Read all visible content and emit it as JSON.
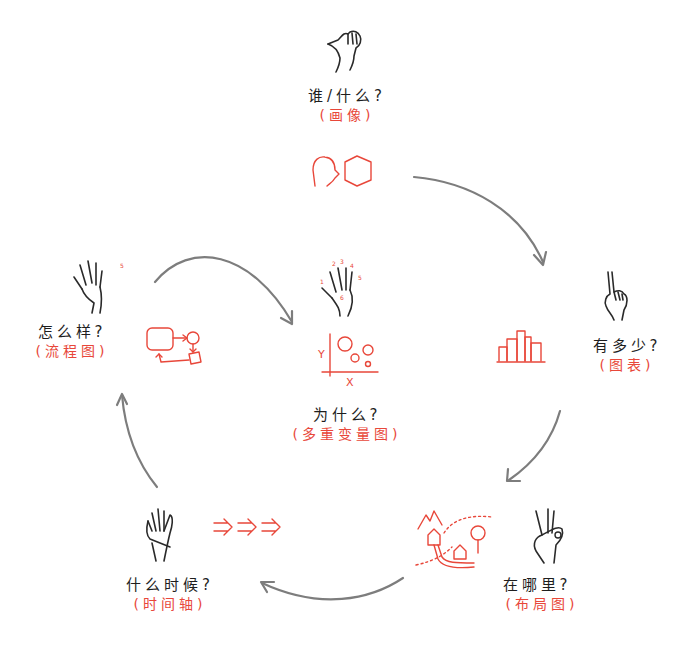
{
  "diagram": {
    "type": "cycle",
    "colors": {
      "text": "#1e1e1e",
      "accent": "#e8473a",
      "arrow": "#7d7d7d"
    },
    "nodes": [
      {
        "id": "who_what",
        "question": "谁/什么?",
        "chart": "(画像)",
        "hand_fingers": "1",
        "icon": "portrait-icon"
      },
      {
        "id": "how_much",
        "question": "有多少?",
        "chart": "(图表)",
        "hand_fingers": "2",
        "icon": "bar-chart-icon"
      },
      {
        "id": "where",
        "question": "在哪里?",
        "chart": "(布局图)",
        "hand_fingers": "3",
        "icon": "map-icon"
      },
      {
        "id": "when",
        "question": "什么时候?",
        "chart": "(时间轴)",
        "hand_fingers": "4",
        "icon": "timeline-arrows-icon"
      },
      {
        "id": "how",
        "question": "怎么样?",
        "chart": "(流程图)",
        "hand_fingers": "5",
        "icon": "flowchart-icon"
      },
      {
        "id": "why",
        "question": "为什么?",
        "chart": "(多重变量图)",
        "hand_fingers": "1 2 3 4 5 6",
        "icon": "scatter-plot-icon"
      }
    ],
    "scatter_axes": {
      "y": "Y",
      "x": "X"
    },
    "edges": [
      {
        "from": "who_what",
        "to": "how_much"
      },
      {
        "from": "how_much",
        "to": "where"
      },
      {
        "from": "where",
        "to": "when"
      },
      {
        "from": "when",
        "to": "how"
      },
      {
        "from": "how",
        "to": "why"
      }
    ]
  }
}
